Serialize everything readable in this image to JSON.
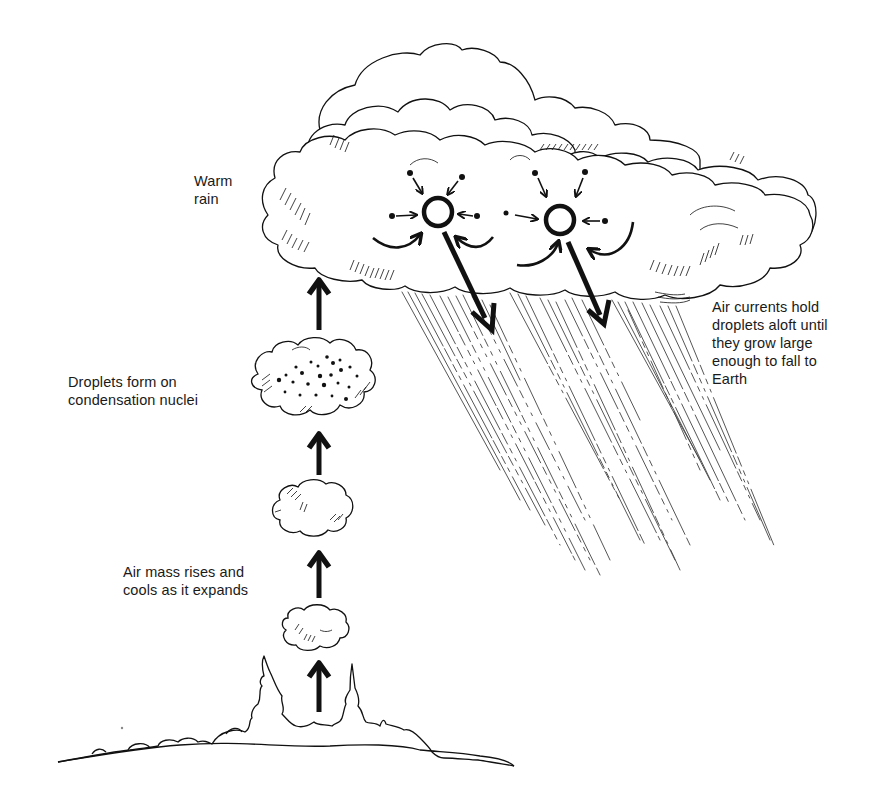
{
  "diagram": {
    "labels": {
      "warm_rain": [
        "Warm",
        "rain"
      ],
      "droplets_form": [
        "Droplets form on",
        "condensation nuclei"
      ],
      "air_mass_rises": [
        "Air mass rises and",
        "cools as it expands"
      ],
      "air_currents": [
        "Air currents hold",
        "droplets aloft until",
        "they grow large",
        "enough to fall to",
        "Earth"
      ]
    },
    "elements": {
      "ground": "hilly landscape with trees",
      "rising_arrows": 4,
      "small_clouds": 3,
      "large_cloud": "cumulonimbus with two droplet-growth diagrams",
      "droplet_circles": 2,
      "falling_arrows": 2,
      "rain": "diagonal rain streaks below cloud"
    },
    "colors": {
      "ink": "#111111",
      "background": "#ffffff"
    }
  }
}
